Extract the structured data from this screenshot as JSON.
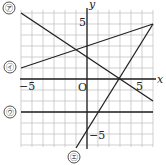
{
  "axes": {
    "x_label": "x",
    "y_label": "y",
    "origin_label": "O",
    "x_tick_neg": "−5",
    "x_tick_pos": "5",
    "y_tick_pos": "5",
    "y_tick_neg": "−5",
    "x_range": [
      -6,
      6
    ],
    "y_range": [
      -6,
      6
    ]
  },
  "lines": [
    {
      "label": "㋐",
      "equation": "y = -2/3 x + 2"
    },
    {
      "label": "㋑",
      "equation": "y = 1/3 x + 3"
    },
    {
      "label": "㋒",
      "equation": "y = -3"
    },
    {
      "label": "㋓",
      "equation": "y = 5/3 x - 5"
    }
  ]
}
